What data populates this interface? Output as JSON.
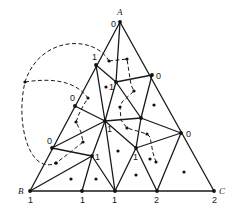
{
  "figure": {
    "corners": [
      {
        "name": "A",
        "x": 120,
        "y": 22,
        "label": "0"
      },
      {
        "name": "B",
        "x": 30,
        "y": 191,
        "label": "1"
      },
      {
        "name": "C",
        "x": 214,
        "y": 191,
        "label": "2"
      }
    ],
    "vertices": [
      {
        "id": "A",
        "x": 120,
        "y": 22,
        "label": "0",
        "lx": 111,
        "ly": 27
      },
      {
        "id": "L1",
        "x": 96,
        "y": 65,
        "label": "1",
        "lx": 92,
        "ly": 60
      },
      {
        "id": "L2",
        "x": 75,
        "y": 106,
        "label": "0",
        "lx": 70,
        "ly": 101
      },
      {
        "id": "L3",
        "x": 52,
        "y": 148,
        "label": "0",
        "lx": 47,
        "ly": 144
      },
      {
        "id": "B",
        "x": 30,
        "y": 191,
        "label": "1",
        "lx": 28,
        "ly": 203
      },
      {
        "id": "R1",
        "x": 152,
        "y": 75,
        "label": "0",
        "lx": 156,
        "ly": 79
      },
      {
        "id": "R2",
        "x": 181,
        "y": 133,
        "label": "0",
        "lx": 186,
        "ly": 137
      },
      {
        "id": "C",
        "x": 214,
        "y": 191,
        "label": "2",
        "lx": 212,
        "ly": 203
      },
      {
        "id": "B1",
        "x": 82,
        "y": 191,
        "label": "1",
        "lx": 80,
        "ly": 203
      },
      {
        "id": "B2",
        "x": 115,
        "y": 191,
        "label": "1",
        "lx": 112,
        "ly": 203
      },
      {
        "id": "B3",
        "x": 157,
        "y": 191,
        "label": "2",
        "lx": 154,
        "ly": 203
      },
      {
        "id": "I1",
        "x": 116,
        "y": 82,
        "label": "1",
        "lx": 109,
        "ly": 90
      },
      {
        "id": "I2",
        "x": 105,
        "y": 121,
        "label": "1",
        "lx": 107,
        "ly": 132
      },
      {
        "id": "I3",
        "x": 141,
        "y": 118,
        "label": "",
        "lx": 0,
        "ly": 0
      },
      {
        "id": "I4",
        "x": 136,
        "y": 148,
        "label": "1",
        "lx": 133,
        "ly": 160
      },
      {
        "id": "I5",
        "x": 92,
        "y": 156,
        "label": "1",
        "lx": 95,
        "ly": 160
      }
    ],
    "edges": [
      [
        "A",
        "B"
      ],
      [
        "B",
        "C"
      ],
      [
        "C",
        "A"
      ],
      [
        "A",
        "I1"
      ],
      [
        "L1",
        "I1"
      ],
      [
        "I1",
        "R1"
      ],
      [
        "L1",
        "I2"
      ],
      [
        "I1",
        "I2"
      ],
      [
        "I1",
        "I3"
      ],
      [
        "R1",
        "I3"
      ],
      [
        "L2",
        "I2"
      ],
      [
        "I2",
        "I3"
      ],
      [
        "I3",
        "R2"
      ],
      [
        "L3",
        "I2"
      ],
      [
        "L3",
        "I5"
      ],
      [
        "I2",
        "I5"
      ],
      [
        "I2",
        "I4"
      ],
      [
        "I3",
        "I4"
      ],
      [
        "I4",
        "R2"
      ],
      [
        "B",
        "I5"
      ],
      [
        "I5",
        "B1"
      ],
      [
        "I5",
        "B2"
      ],
      [
        "I2",
        "B2"
      ],
      [
        "I4",
        "B2"
      ],
      [
        "I4",
        "B3"
      ],
      [
        "R2",
        "B3"
      ]
    ],
    "face_dots": [
      [
        106,
        87
      ],
      [
        154,
        105
      ],
      [
        150,
        159
      ],
      [
        118,
        151
      ],
      [
        136,
        175
      ],
      [
        184,
        172
      ],
      [
        96,
        179
      ],
      [
        71,
        179
      ],
      [
        56,
        163
      ]
    ],
    "path_dots": [
      [
        109,
        61
      ],
      [
        127,
        59
      ],
      [
        134,
        91
      ],
      [
        120,
        107
      ],
      [
        127,
        128
      ],
      [
        147,
        134
      ],
      [
        156,
        162
      ],
      [
        88,
        98
      ],
      [
        76,
        122
      ],
      [
        83,
        142
      ],
      [
        56,
        163
      ],
      [
        25,
        82
      ]
    ],
    "dashed_paths": [
      "M109,61 L127,59 L131,85 L134,91 L122,102 L120,107 L121,120 L127,128 L147,134 L150,137 L153,153 L156,162",
      "M109,61 C95,35 40,35 25,82 C15,125 30,175 56,163",
      "M25,82 C50,78 75,80 88,98 L83,106 L79,114 L76,122 L81,132 L83,142 L68,154 L56,163"
    ]
  }
}
